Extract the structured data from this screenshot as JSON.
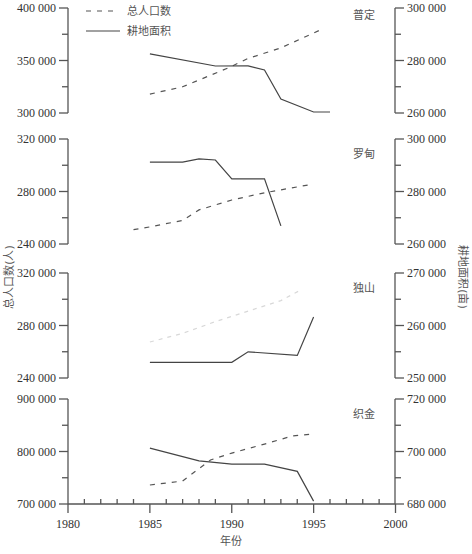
{
  "legend": {
    "population_label": "总人口数",
    "area_label": "耕地面积"
  },
  "axes": {
    "left_title": "总人口数(人)",
    "right_title": "耕地面积(亩)",
    "x_title": "年份",
    "x_ticks": [
      1980,
      1985,
      1990,
      1995,
      2000
    ]
  },
  "chart_data": {
    "type": "line",
    "title": "",
    "xlabel": "年份",
    "ylabel_left": "总人口数(人)",
    "ylabel_right": "耕地面积(亩)",
    "xlim": [
      1980,
      2000
    ],
    "legend": [
      "总人口数",
      "耕地面积"
    ],
    "legend_position": "top-left",
    "grid": false,
    "panels": [
      {
        "name": "普定",
        "left_ticks": [
          "400 000",
          "350 000",
          "300 000"
        ],
        "left_range": [
          300000,
          400000
        ],
        "right_ticks": [
          "300 000",
          "280 000",
          "260 000"
        ],
        "right_range": [
          260000,
          300000
        ],
        "series": [
          {
            "name": "总人口数",
            "axis": "left",
            "style": "dashed",
            "x": [
              1985,
              1987,
              1989.8,
              1991,
              1993,
              1995.4
            ],
            "values": [
              318000,
              325000,
              343000,
              352000,
              362000,
              379000
            ]
          },
          {
            "name": "耕地面积",
            "axis": "right",
            "style": "solid",
            "x": [
              1985,
              1989,
              1991,
              1992,
              1993,
              1995,
              1996
            ],
            "values": [
              282500,
              277900,
              278000,
              276400,
              265300,
              260400,
              260400
            ]
          }
        ]
      },
      {
        "name": "罗甸",
        "left_ticks": [
          "320 000",
          "280 000",
          "240 000"
        ],
        "left_range": [
          240000,
          320000
        ],
        "right_ticks": [
          "300 000",
          "280 000",
          "260 000"
        ],
        "right_range": [
          260000,
          300000
        ],
        "series": [
          {
            "name": "总人口数",
            "axis": "left",
            "style": "dashed",
            "x": [
              1984,
              1985,
              1987,
              1988,
              1990,
              1992,
              1995
            ],
            "values": [
              251000,
              253000,
              258000,
              266000,
              273500,
              279000,
              285700
            ]
          },
          {
            "name": "耕地面积",
            "axis": "right",
            "style": "solid",
            "x": [
              1985,
              1987,
              1988,
              1989,
              1990,
              1992,
              1993
            ],
            "values": [
              291200,
              291200,
              292400,
              292000,
              284800,
              284800,
              266900
            ]
          }
        ]
      },
      {
        "name": "独山",
        "left_ticks": [
          "320 000",
          "280 000",
          "240 000"
        ],
        "left_range": [
          240000,
          320000
        ],
        "right_ticks": [
          "270 000",
          "260 000",
          "250 000"
        ],
        "right_range": [
          250000,
          270000
        ],
        "series": [
          {
            "name": "总人口数",
            "axis": "left",
            "style": "dashed-faint",
            "x": [
              1985,
              1987,
              1989,
              1991,
              1993,
              1994.2
            ],
            "values": [
              267400,
              274000,
              283000,
              291000,
              299000,
              307000
            ]
          },
          {
            "name": "耕地面积",
            "axis": "right",
            "style": "solid",
            "x": [
              1985,
              1990,
              1991,
              1994,
              1995
            ],
            "values": [
              253000,
              253000,
              255000,
              254300,
              261600
            ]
          }
        ]
      },
      {
        "name": "织金",
        "left_ticks": [
          "900 000",
          "800 000",
          "700 000"
        ],
        "left_range": [
          700000,
          900000
        ],
        "right_ticks": [
          "720 000",
          "700 000",
          "680 000"
        ],
        "right_range": [
          680000,
          720000
        ],
        "series": [
          {
            "name": "总人口数",
            "axis": "left",
            "style": "dashed",
            "x": [
              1985,
              1987,
              1988.7,
              1990,
              1992,
              1993.7,
              1995
            ],
            "values": [
              736200,
              743800,
              783800,
              797000,
              814000,
              829500,
              833300
            ]
          },
          {
            "name": "耕地面积",
            "axis": "right",
            "style": "solid",
            "x": [
              1985,
              1988,
              1990,
              1992,
              1994,
              1995
            ],
            "values": [
              701300,
              696400,
              695200,
              695200,
              692400,
              681100
            ]
          }
        ]
      }
    ]
  },
  "colors": {
    "axis": "#555555",
    "line": "#444444",
    "text": "#333333"
  }
}
